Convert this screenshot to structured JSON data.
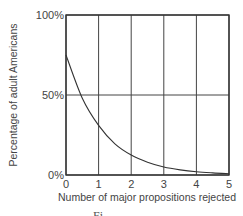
{
  "chart_data": {
    "type": "line",
    "title": "",
    "xlabel": "Number of major propositions rejected",
    "ylabel": "Percentage of adult Americans",
    "x": [
      0,
      0.5,
      1,
      1.5,
      2,
      2.5,
      3,
      3.5,
      4,
      4.5,
      5
    ],
    "series": [
      {
        "name": "Percentage of adult Americans",
        "values": [
          75,
          48,
          31,
          19.5,
          12.5,
          8,
          5,
          3.2,
          2,
          1.3,
          0.8
        ]
      }
    ],
    "xticks": [
      "0",
      "1",
      "2",
      "3",
      "4",
      "5"
    ],
    "yticks": [
      "0%",
      "50%",
      "100%"
    ],
    "xlim": [
      0,
      5
    ],
    "ylim": [
      0,
      100
    ],
    "grid": true,
    "legend": "none"
  },
  "caption_fragment": "Fi"
}
